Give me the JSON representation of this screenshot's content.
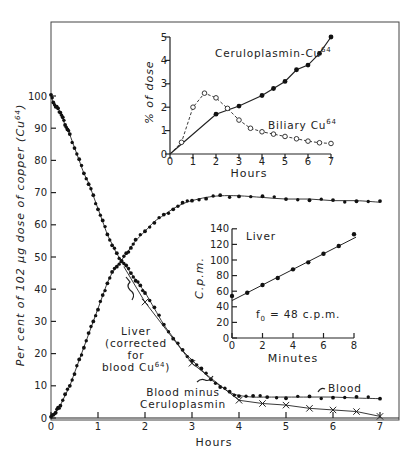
{
  "chart_data": [
    {
      "id": "main",
      "type": "line",
      "title": "",
      "xlabel": "Hours",
      "ylabel": "Per cent of 102 µg dose of copper (Cu64)",
      "xlim": [
        0,
        7
      ],
      "ylim": [
        0,
        100
      ],
      "xticks": [
        0,
        1,
        2,
        3,
        4,
        5,
        6,
        7
      ],
      "yticks": [
        0,
        10,
        20,
        30,
        40,
        50,
        60,
        70,
        80,
        90,
        100
      ],
      "grid": false,
      "series": [
        {
          "name": "Blood",
          "marker": "dot",
          "x": [
            0,
            0.05,
            0.1,
            0.15,
            0.2,
            0.25,
            0.3,
            0.35,
            0.4,
            0.5,
            0.6,
            0.7,
            0.8,
            0.9,
            1.0,
            1.1,
            1.2,
            1.3,
            1.4,
            1.5,
            1.6,
            1.7,
            1.8,
            1.9,
            2.0,
            2.2,
            2.4,
            2.6,
            2.8,
            3.0,
            3.2,
            3.4,
            3.6,
            3.8,
            4.0,
            4.3,
            4.6,
            5.0,
            5.5,
            6.0,
            6.5,
            7.0
          ],
          "y": [
            100,
            98,
            97,
            96,
            95,
            93,
            91,
            90,
            88,
            84,
            80,
            76,
            73,
            69,
            65,
            61,
            57,
            54,
            51,
            49,
            47,
            45,
            43,
            41,
            39,
            34,
            29,
            25,
            21,
            18,
            15,
            12,
            10,
            8,
            7,
            6.5,
            6.5,
            6.5,
            6.5,
            6.5,
            6.2,
            6
          ]
        },
        {
          "name": "Liver (corrected for blood Cu64)",
          "marker": "dot",
          "x": [
            0,
            0.05,
            0.1,
            0.15,
            0.2,
            0.3,
            0.4,
            0.5,
            0.6,
            0.7,
            0.8,
            0.9,
            1.0,
            1.1,
            1.2,
            1.3,
            1.4,
            1.5,
            1.6,
            1.7,
            1.8,
            2.0,
            2.2,
            2.4,
            2.6,
            2.8,
            3.0,
            3.3,
            3.6,
            4.0,
            4.5,
            5.0,
            5.5,
            6.0,
            6.5,
            7.0
          ],
          "y": [
            0,
            1,
            2,
            3,
            4,
            7,
            10,
            14,
            18,
            22,
            26,
            30,
            34,
            38,
            42,
            45,
            47,
            49,
            51,
            53,
            55,
            58,
            61,
            63,
            65,
            66.5,
            67.5,
            68.5,
            69,
            69,
            68.5,
            68,
            68,
            67.5,
            67.5,
            67
          ]
        },
        {
          "name": "Blood minus Ceruloplasmin",
          "marker": "x",
          "x": [
            2,
            3,
            4,
            4.5,
            5,
            5.5,
            6,
            6.5,
            7
          ],
          "y": [
            36,
            17,
            5.5,
            4.5,
            4,
            3,
            2.5,
            2,
            0.5
          ]
        }
      ],
      "annotations": [
        "Liver (corrected for blood Cu64)",
        "Blood minus Ceruloplasmin",
        "Blood"
      ]
    },
    {
      "id": "inset_top",
      "type": "line",
      "xlabel": "Hours",
      "ylabel": "% of dose",
      "xlim": [
        0,
        7
      ],
      "ylim": [
        0,
        5
      ],
      "xticks": [
        0,
        1,
        2,
        3,
        4,
        5,
        6,
        7
      ],
      "yticks": [
        0,
        1,
        2,
        3,
        4,
        5
      ],
      "series": [
        {
          "name": "Ceruloplasmin-Cu64",
          "marker": "filled-circle",
          "style": "solid",
          "x": [
            0,
            2,
            3,
            4,
            4.5,
            5,
            5.5,
            6,
            6.5,
            7
          ],
          "y": [
            0,
            1.7,
            2.05,
            2.5,
            2.8,
            3.1,
            3.6,
            3.8,
            4.3,
            5.0
          ]
        },
        {
          "name": "Biliary Cu64",
          "marker": "open-circle",
          "style": "dashed",
          "x": [
            0,
            0.5,
            1,
            1.5,
            2,
            2.5,
            3,
            3.5,
            4,
            4.5,
            5,
            5.5,
            6,
            6.5,
            7
          ],
          "y": [
            0,
            0.5,
            2.0,
            2.6,
            2.4,
            1.95,
            1.45,
            1.1,
            0.95,
            0.85,
            0.75,
            0.65,
            0.55,
            0.48,
            0.45
          ]
        }
      ]
    },
    {
      "id": "inset_liver",
      "type": "scatter",
      "title": "Liver",
      "xlabel": "Minutes",
      "ylabel": "C.p.m.",
      "xlim": [
        0,
        8
      ],
      "ylim": [
        0,
        140
      ],
      "xticks": [
        0,
        2,
        4,
        6,
        8
      ],
      "yticks": [
        0,
        20,
        40,
        60,
        80,
        100,
        120,
        140
      ],
      "series": [
        {
          "name": "Liver",
          "marker": "filled-circle",
          "x": [
            0,
            1,
            2,
            3,
            4,
            5,
            6,
            7,
            8
          ],
          "y": [
            54,
            58,
            68,
            77,
            88,
            97,
            108,
            118,
            133
          ]
        }
      ],
      "fit_line": {
        "x": [
          0,
          8
        ],
        "y": [
          48,
          128
        ]
      },
      "annotation": "f0 = 48 c.p.m."
    }
  ],
  "labels": {
    "main_xlabel": "Hours",
    "main_ylabel": "Per cent of 102 µg dose of copper (Cu",
    "main_ylabel_sup": "64",
    "main_ylabel_end": ")",
    "inset_top_xlabel": "Hours",
    "inset_top_ylabel": "% of dose",
    "ceruloplasmin": "Ceruloplasmin-Cu",
    "biliary": "Biliary Cu",
    "sup64": "64",
    "liver_inset_title": "Liver",
    "liver_inset_xlabel": "Minutes",
    "liver_inset_ylabel": "C.p.m.",
    "f0": "f",
    "f0_sub": "0",
    "f0_val": " = 48 c.p.m.",
    "liver_ann_1": "Liver",
    "liver_ann_2": "(corrected",
    "liver_ann_3": "for",
    "liver_ann_4": "blood Cu",
    "liver_ann_4_end": ")",
    "bmc_1": "Blood minus",
    "bmc_2": "Ceruloplasmin",
    "blood": "Blood"
  }
}
